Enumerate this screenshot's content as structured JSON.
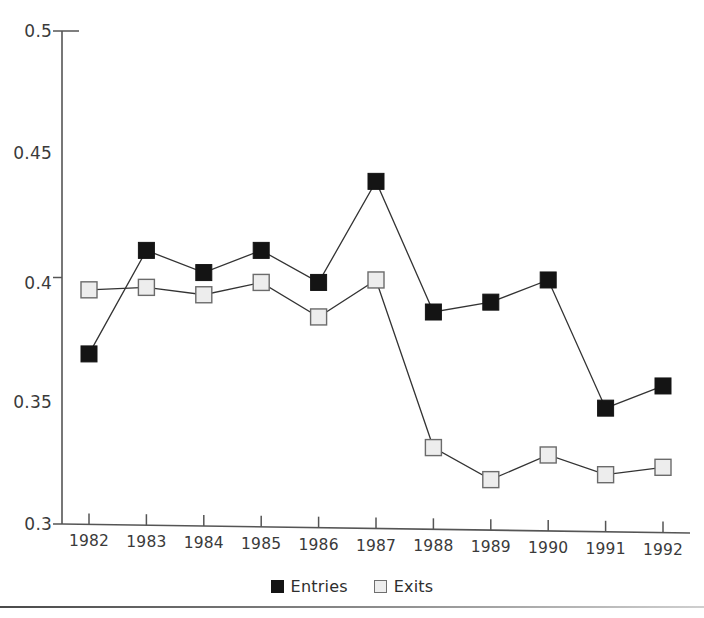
{
  "chart_data": {
    "type": "line",
    "title": "",
    "subtitle": "",
    "xlabel": "",
    "ylabel": "",
    "categories": [
      "1982",
      "1983",
      "1984",
      "1985",
      "1986",
      "1987",
      "1988",
      "1989",
      "1990",
      "1991",
      "1992"
    ],
    "series": [
      {
        "name": "Entries",
        "marker": "filled-square",
        "color": "#141414",
        "values": [
          0.369,
          0.411,
          0.402,
          0.411,
          0.398,
          0.439,
          0.386,
          0.39,
          0.399,
          0.347,
          0.356
        ]
      },
      {
        "name": "Exits",
        "marker": "open-square",
        "color": "#ededed",
        "values": [
          0.395,
          0.396,
          0.393,
          0.398,
          0.384,
          0.399,
          0.331,
          0.318,
          0.328,
          0.32,
          0.323
        ]
      }
    ],
    "ylim": [
      0.3,
      0.5
    ],
    "ytick_values": [
      0.3,
      0.35,
      0.4,
      0.45,
      0.5
    ],
    "ytick_labels": [
      "0.3",
      "0.35",
      "0.4",
      "0.45",
      "0.5"
    ],
    "ytick_marks_drawn": [
      0.3,
      0.4,
      0.5
    ],
    "xtick_labels": [
      "1982",
      "1983",
      "1984",
      "1985",
      "1986",
      "1987",
      "1988",
      "1989",
      "1990",
      "1991",
      "1992"
    ],
    "grid": false,
    "legend_position": "bottom-center",
    "legend": [
      {
        "label": "Entries",
        "swatch": "filled-square-dark"
      },
      {
        "label": "Exits",
        "swatch": "open-square-light"
      }
    ],
    "axis_color": "#555555",
    "line_color": "#333333",
    "background": "#ffffff"
  },
  "decor": {
    "bottom_rule": "horizontal-rule"
  }
}
